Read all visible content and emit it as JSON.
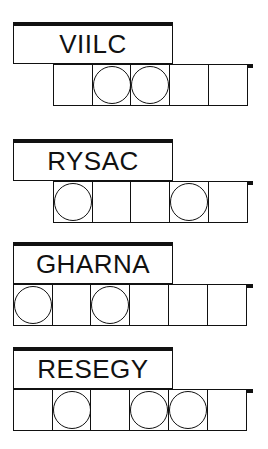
{
  "puzzles": [
    {
      "scrambled": "VIILC",
      "letters": 5,
      "cell_start_col": 1,
      "circled": [
        1,
        2
      ],
      "top": 22
    },
    {
      "scrambled": "RYSAC",
      "letters": 5,
      "cell_start_col": 1,
      "circled": [
        0,
        3
      ],
      "top": 139
    },
    {
      "scrambled": "GHARNA",
      "letters": 6,
      "cell_start_col": 0,
      "circled": [
        0,
        2
      ],
      "top": 242
    },
    {
      "scrambled": "RESEGY",
      "letters": 6,
      "cell_start_col": 0,
      "circled": [
        1,
        3,
        4
      ],
      "top": 347
    }
  ]
}
